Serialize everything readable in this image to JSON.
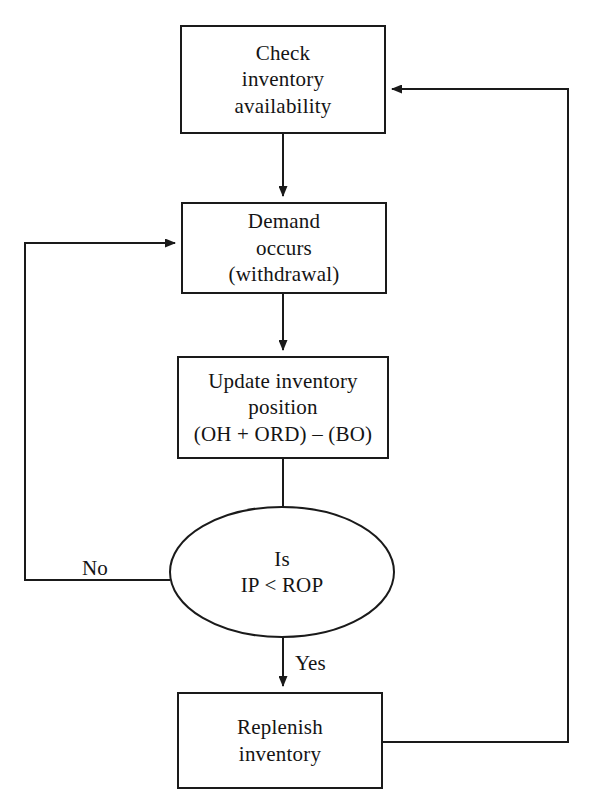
{
  "diagram": {
    "stroke_color": "#1a1a1a",
    "text_color": "#141414",
    "background_color": "#ffffff",
    "nodes": [
      {
        "id": "check-inventory-availability",
        "shape": "rectangle",
        "lines": [
          "Check",
          "inventory",
          "availability"
        ]
      },
      {
        "id": "demand-occurs",
        "shape": "rectangle",
        "lines": [
          "Demand",
          "occurs",
          "(withdrawal)"
        ]
      },
      {
        "id": "update-inventory-position",
        "shape": "rectangle",
        "lines": [
          "Update inventory",
          "position",
          "(OH + ORD) – (BO)"
        ]
      },
      {
        "id": "is-ip-less-than-rop",
        "shape": "ellipse",
        "lines": [
          "Is",
          "IP < ROP"
        ]
      },
      {
        "id": "replenish-inventory",
        "shape": "rectangle",
        "lines": [
          "Replenish",
          "inventory"
        ]
      }
    ],
    "edge_labels": [
      {
        "id": "no-branch",
        "text": "No"
      },
      {
        "id": "yes-branch",
        "text": "Yes"
      }
    ]
  }
}
